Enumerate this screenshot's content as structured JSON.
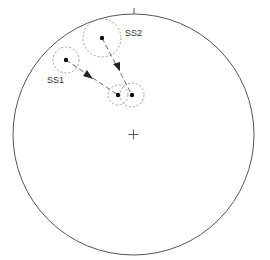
{
  "diagram": {
    "type": "stereonet-plot",
    "net": {
      "cx": 133.5,
      "cy": 134.5,
      "r": 120.5,
      "stroke": "#555555"
    },
    "north_tick": {
      "x": 134,
      "y1": 8,
      "y2": 14
    },
    "center_mark": {
      "x": 133.5,
      "y": 134.5,
      "size": 5
    },
    "labels": {
      "ss1": "SS1",
      "ss2": "SS2"
    },
    "points": [
      {
        "id": "ss1-start",
        "x": 66,
        "y": 60,
        "cone_r": 13
      },
      {
        "id": "ss2-start",
        "x": 102,
        "y": 38,
        "cone_r": 19
      },
      {
        "id": "ss1-end",
        "x": 118,
        "y": 95,
        "cone_r": 10
      },
      {
        "id": "ss2-end",
        "x": 132,
        "y": 95,
        "cone_r": 12
      }
    ],
    "paths": [
      {
        "from": "ss1-start",
        "to": "ss1-end",
        "arrow_at": [
          89,
          76
        ]
      },
      {
        "from": "ss2-start",
        "to": "ss2-end",
        "arrow_at": [
          118,
          67
        ]
      }
    ]
  }
}
